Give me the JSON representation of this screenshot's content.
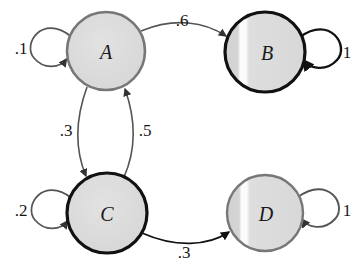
{
  "diagram": {
    "type": "markov-chain-state-diagram",
    "background_color": "#ffffff",
    "node_fill_color": "#dcdcdc",
    "node_highlight_color": "#f7f7f7",
    "thick_stroke_color": "#111111",
    "thin_stroke_color": "#777777",
    "nodes": [
      {
        "id": "A",
        "label": "A",
        "cx": 106,
        "cy": 51,
        "r": 39,
        "stroke": "#777777",
        "stroke_width": 2.6,
        "highlight": false
      },
      {
        "id": "B",
        "label": "B",
        "cx": 265,
        "cy": 52,
        "r": 40,
        "stroke": "#111111",
        "stroke_width": 3.2,
        "highlight": true
      },
      {
        "id": "C",
        "label": "C",
        "cx": 107,
        "cy": 213,
        "r": 40,
        "stroke": "#111111",
        "stroke_width": 3.2,
        "highlight": false
      },
      {
        "id": "D",
        "label": "D",
        "cx": 265,
        "cy": 213,
        "r": 38,
        "stroke": "#777777",
        "stroke_width": 2.4,
        "highlight": true
      }
    ],
    "edges": [
      {
        "id": "a-self",
        "from": "A",
        "to": "A",
        "label": ".1",
        "label_x": 21,
        "label_y": 48,
        "kind": "self-loop",
        "side": "left",
        "stroke": "#555555",
        "stroke_width": 1.7
      },
      {
        "id": "a-to-b",
        "from": "A",
        "to": "B",
        "label": ".6",
        "label_x": 182,
        "label_y": 20,
        "kind": "arc",
        "stroke": "#555555",
        "stroke_width": 1.6
      },
      {
        "id": "b-self",
        "from": "B",
        "to": "B",
        "label": "1",
        "label_x": 347,
        "label_y": 52,
        "kind": "self-loop",
        "side": "right",
        "stroke": "#111111",
        "stroke_width": 2.4
      },
      {
        "id": "a-to-c",
        "from": "A",
        "to": "C",
        "label": ".3",
        "label_x": 66,
        "label_y": 130,
        "kind": "arc",
        "stroke": "#555555",
        "stroke_width": 1.6
      },
      {
        "id": "c-to-a",
        "from": "C",
        "to": "A",
        "label": ".5",
        "label_x": 145,
        "label_y": 130,
        "kind": "arc",
        "stroke": "#555555",
        "stroke_width": 1.6
      },
      {
        "id": "c-self",
        "from": "C",
        "to": "C",
        "label": ".2",
        "label_x": 21,
        "label_y": 210,
        "kind": "self-loop",
        "side": "left",
        "stroke": "#555555",
        "stroke_width": 1.7
      },
      {
        "id": "c-to-d",
        "from": "C",
        "to": "D",
        "label": ".3",
        "label_x": 184,
        "label_y": 252,
        "kind": "arc",
        "stroke": "#111111",
        "stroke_width": 1.8
      },
      {
        "id": "d-self",
        "from": "D",
        "to": "D",
        "label": "1",
        "label_x": 347,
        "label_y": 210,
        "kind": "self-loop",
        "side": "right",
        "stroke": "#555555",
        "stroke_width": 1.9
      }
    ]
  }
}
